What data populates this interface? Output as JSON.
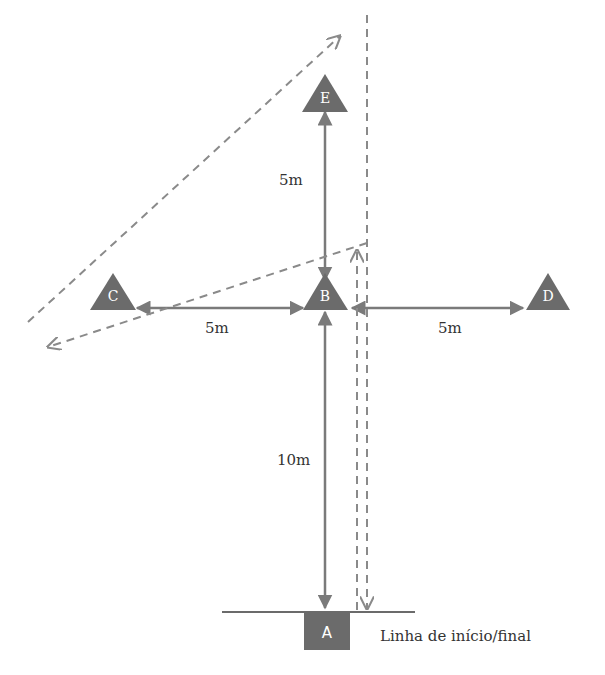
{
  "diagram": {
    "title": "",
    "colors": {
      "cone": "#6b6b6b",
      "arrow": "#7a7a7a",
      "dashed": "#8a8a8a",
      "line": "#6b6b6b",
      "text": "#333333"
    },
    "cones": [
      {
        "id": "E",
        "label": "E",
        "x": 325,
        "y": 95
      },
      {
        "id": "C",
        "label": "C",
        "x": 115,
        "y": 293
      },
      {
        "id": "B",
        "label": "B",
        "x": 325,
        "y": 293
      },
      {
        "id": "D",
        "label": "D",
        "x": 545,
        "y": 293
      }
    ],
    "start_marker": {
      "id": "A",
      "label": "A"
    },
    "distances": {
      "b_to_e": "5m",
      "b_to_c": "5m",
      "b_to_d": "5m",
      "a_to_b": "10m"
    },
    "start_line_caption": "Linha de início/final"
  }
}
